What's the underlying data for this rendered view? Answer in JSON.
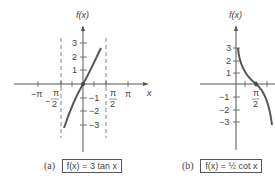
{
  "figures": [
    {
      "id": "a",
      "caption_letter": "(a)",
      "function_label": "f(x) = 3 tan x",
      "y_axis_label": "f(x)",
      "x_axis_label": "x",
      "x_ticks": [
        "−π",
        "−π/2",
        "π/2",
        "π"
      ],
      "y_ticks": [
        "3",
        "2",
        "1",
        "−1",
        "−2",
        "−3"
      ],
      "asymptotes": [
        "x = −π/2",
        "x = π/2"
      ]
    },
    {
      "id": "b",
      "caption_letter": "(b)",
      "function_label": "f(x) = ½ cot x",
      "y_axis_label": "f(x)",
      "x_ticks": [
        "π/2"
      ],
      "y_ticks": [
        "3",
        "2",
        "1",
        "−1",
        "−2",
        "−3"
      ]
    }
  ],
  "labels": {
    "a_fx": "f(x)",
    "a_x": "x",
    "a_neg_pi": "−π",
    "a_neg_pi_num": "π",
    "a_neg_pi_den": "2",
    "a_pi_num": "π",
    "a_pi_den": "2",
    "a_pi": "π",
    "a_y3": "3",
    "a_y2": "2",
    "a_y1": "1",
    "a_ym1": "−1",
    "a_ym2": "−2",
    "a_ym3": "−3",
    "a_neg_sign": "−",
    "b_fx": "f(x)",
    "b_y3": "3",
    "b_y2": "2",
    "b_y1": "1",
    "b_ym1": "−1",
    "b_ym2": "−2",
    "b_ym3": "−3",
    "b_pi_num": "π",
    "b_pi_den": "2"
  },
  "captions": {
    "a_letter": "(a)",
    "a_func": "f(x) = 3 tan x",
    "b_letter": "(b)",
    "b_func": "f(x) = ½ cot x"
  }
}
